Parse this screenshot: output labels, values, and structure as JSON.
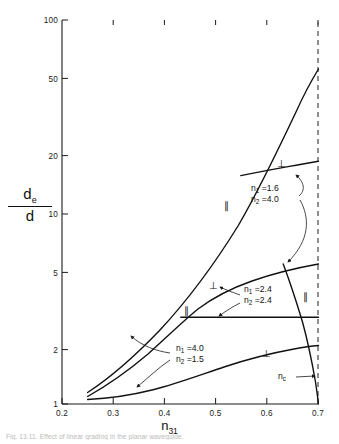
{
  "figure": {
    "caption": "Fig. 13.11.  Effect of linear grading in the planar waveguide."
  },
  "chart_data": {
    "type": "line",
    "title": "",
    "xlabel": "n31",
    "ylabel": "de/d",
    "x_scale": "linear",
    "y_scale": "log",
    "xlim": [
      0.2,
      0.7
    ],
    "ylim": [
      1,
      100
    ],
    "grid": false,
    "legend_position": "none",
    "xticks": [
      "0.2",
      "0.3",
      "0.4",
      "0.5",
      "0.6",
      "0.7"
    ],
    "xtick_values": [
      0.2,
      0.3,
      0.4,
      0.5,
      0.6,
      0.7
    ],
    "yticks": [
      "1",
      "2",
      "5",
      "10",
      "20",
      "50",
      "100"
    ],
    "ytick_values": [
      1,
      2,
      5,
      10,
      20,
      50,
      100
    ],
    "series": [
      {
        "name": "n1=1.6 n2=4.0 parallel",
        "polarization": "parallel",
        "points": [
          [
            0.25,
            1.22
          ],
          [
            0.28,
            1.45
          ],
          [
            0.31,
            1.75
          ],
          [
            0.34,
            2.1
          ],
          [
            0.37,
            2.55
          ],
          [
            0.4,
            3.05
          ],
          [
            0.43,
            3.75
          ],
          [
            0.46,
            4.7
          ],
          [
            0.49,
            5.9
          ],
          [
            0.52,
            7.6
          ],
          [
            0.55,
            10.2
          ],
          [
            0.58,
            14.0
          ],
          [
            0.61,
            19.5
          ],
          [
            0.64,
            27.0
          ],
          [
            0.67,
            37.5
          ],
          [
            0.695,
            48.0
          ],
          [
            0.705,
            52.0
          ]
        ]
      },
      {
        "name": "n1=1.6 n2=4.0 perpendicular",
        "polarization": "perpendicular",
        "points": [
          [
            0.545,
            14.2
          ],
          [
            0.575,
            15.4
          ],
          [
            0.605,
            16.6
          ],
          [
            0.635,
            17.8
          ],
          [
            0.662,
            18.8
          ],
          [
            0.685,
            19.5
          ],
          [
            0.705,
            19.9
          ]
        ]
      },
      {
        "name": "n1=2.4 n2=2.4 perpendicular",
        "polarization": "perpendicular",
        "points": [
          [
            0.25,
            1.15
          ],
          [
            0.28,
            1.32
          ],
          [
            0.31,
            1.52
          ],
          [
            0.34,
            1.78
          ],
          [
            0.37,
            2.08
          ],
          [
            0.4,
            2.45
          ],
          [
            0.43,
            2.9
          ],
          [
            0.46,
            3.3
          ],
          [
            0.49,
            3.7
          ],
          [
            0.52,
            4.05
          ],
          [
            0.55,
            4.4
          ],
          [
            0.58,
            4.75
          ],
          [
            0.61,
            5.05
          ],
          [
            0.64,
            5.35
          ],
          [
            0.67,
            5.6
          ],
          [
            0.705,
            5.85
          ]
        ]
      },
      {
        "name": "n1=2.4 n2=2.4 parallel",
        "polarization": "parallel",
        "points": [
          [
            0.432,
            3.0
          ],
          [
            0.705,
            3.0
          ]
        ]
      },
      {
        "name": "n1=4.0 n2=1.5 perpendicular",
        "polarization": "perpendicular",
        "points": [
          [
            0.25,
            1.1
          ],
          [
            0.29,
            1.13
          ],
          [
            0.33,
            1.18
          ],
          [
            0.37,
            1.26
          ],
          [
            0.41,
            1.36
          ],
          [
            0.45,
            1.48
          ],
          [
            0.49,
            1.6
          ],
          [
            0.53,
            1.73
          ],
          [
            0.57,
            1.85
          ],
          [
            0.61,
            1.95
          ],
          [
            0.65,
            2.03
          ],
          [
            0.69,
            2.08
          ],
          [
            0.705,
            2.1
          ]
        ]
      },
      {
        "name": "n1=4.0 n2=1.5 parallel",
        "polarization": "parallel",
        "points": [
          [
            0.632,
            5.85
          ],
          [
            0.651,
            4.5
          ],
          [
            0.668,
            3.4
          ],
          [
            0.682,
            2.45
          ],
          [
            0.693,
            1.7
          ],
          [
            0.7,
            1.28
          ],
          [
            0.704,
            1.05
          ],
          [
            0.705,
            1.0
          ]
        ]
      }
    ],
    "annotations": [
      {
        "id": "pair-1",
        "line1": "n1 = 1.6",
        "line2": "n2 = 4.0",
        "n1": "1.6",
        "n2": "4.0"
      },
      {
        "id": "pair-2",
        "line1": "n1 = 2.4",
        "line2": "n2 = 2.4",
        "n1": "2.4",
        "n2": "2.4"
      },
      {
        "id": "pair-3",
        "line1": "n1 = 4.0",
        "line2": "n2 = 1.5",
        "n1": "4.0",
        "n2": "1.5"
      },
      {
        "id": "critical-index",
        "label": "nc"
      }
    ],
    "polarization_marks": [
      {
        "symbol": "⊥",
        "name": "perp-upper-right"
      },
      {
        "symbol": "∥",
        "name": "par-steep-rising"
      },
      {
        "symbol": "⊥",
        "name": "perp-middle"
      },
      {
        "symbol": "∥",
        "name": "par-horizontal"
      },
      {
        "symbol": "∥",
        "name": "par-descending"
      },
      {
        "symbol": "⊥",
        "name": "perp-lower"
      }
    ],
    "critical_line": {
      "x": 0.705,
      "style": "dashed",
      "label": "nc"
    },
    "colors": {
      "curve": "#111111",
      "axis": "#1a1a1a",
      "dashed": "#555555",
      "background": "#ffffff"
    }
  },
  "axes": {
    "y_numerator": "d",
    "y_numerator_sub": "e",
    "y_denominator": "d",
    "x_name": "n",
    "x_sub": "31"
  }
}
